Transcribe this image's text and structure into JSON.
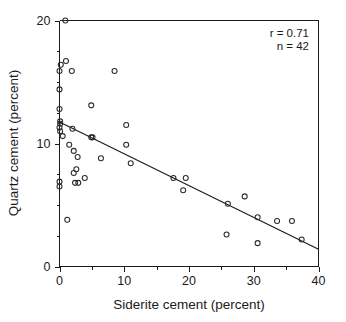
{
  "chart_data": {
    "type": "scatter",
    "title": "",
    "xlabel": "Siderite cement (percent)",
    "ylabel": "Quartz cement (percent)",
    "xlim": [
      0,
      40
    ],
    "ylim": [
      0,
      20
    ],
    "xticks": [
      0,
      10,
      20,
      30,
      40
    ],
    "yticks": [
      0,
      10,
      20
    ],
    "xtick_labels": [
      "0",
      "10",
      "20",
      "30",
      "40"
    ],
    "ytick_labels": [
      "0",
      "10",
      "20"
    ],
    "x_minor_interval": 5,
    "y_minor_interval": 2.5,
    "grid": false,
    "legend": "none",
    "marker": "open-circle",
    "annotations": [
      {
        "label": "r = 0.71"
      },
      {
        "label": "n = 42"
      }
    ],
    "correlation_r": 0.71,
    "sample_n": 42,
    "points": [
      {
        "x": 0.9,
        "y": 20.0
      },
      {
        "x": 0.2,
        "y": 16.4
      },
      {
        "x": 0.0,
        "y": 15.9
      },
      {
        "x": 1.0,
        "y": 16.7
      },
      {
        "x": 1.9,
        "y": 15.9
      },
      {
        "x": 8.5,
        "y": 15.9
      },
      {
        "x": 0.0,
        "y": 14.4
      },
      {
        "x": 4.9,
        "y": 13.1
      },
      {
        "x": 0.0,
        "y": 12.8
      },
      {
        "x": 0.1,
        "y": 11.8
      },
      {
        "x": 0.1,
        "y": 11.6
      },
      {
        "x": 0.0,
        "y": 11.3
      },
      {
        "x": 10.3,
        "y": 11.5
      },
      {
        "x": 0.1,
        "y": 11.0
      },
      {
        "x": 2.0,
        "y": 11.2
      },
      {
        "x": 0.5,
        "y": 10.6
      },
      {
        "x": 4.9,
        "y": 10.5
      },
      {
        "x": 5.1,
        "y": 10.5
      },
      {
        "x": 10.3,
        "y": 9.9
      },
      {
        "x": 1.5,
        "y": 9.9
      },
      {
        "x": 2.2,
        "y": 9.4
      },
      {
        "x": 2.8,
        "y": 8.9
      },
      {
        "x": 6.4,
        "y": 8.8
      },
      {
        "x": 11.0,
        "y": 8.4
      },
      {
        "x": 2.6,
        "y": 7.9
      },
      {
        "x": 2.2,
        "y": 7.6
      },
      {
        "x": 3.9,
        "y": 7.2
      },
      {
        "x": 17.6,
        "y": 7.2
      },
      {
        "x": 19.5,
        "y": 7.2
      },
      {
        "x": 0.0,
        "y": 6.9
      },
      {
        "x": 2.4,
        "y": 6.8
      },
      {
        "x": 2.9,
        "y": 6.8
      },
      {
        "x": 0.0,
        "y": 6.5
      },
      {
        "x": 19.1,
        "y": 6.2
      },
      {
        "x": 28.6,
        "y": 5.7
      },
      {
        "x": 26.0,
        "y": 5.1
      },
      {
        "x": 30.6,
        "y": 4.0
      },
      {
        "x": 1.2,
        "y": 3.8
      },
      {
        "x": 33.6,
        "y": 3.7
      },
      {
        "x": 35.9,
        "y": 3.7
      },
      {
        "x": 25.8,
        "y": 2.6
      },
      {
        "x": 37.4,
        "y": 2.2
      },
      {
        "x": 30.6,
        "y": 1.9
      }
    ],
    "fit_line": {
      "x_start": 0,
      "y_start": 11.75,
      "x_end": 40,
      "y_end": 1.4
    }
  }
}
